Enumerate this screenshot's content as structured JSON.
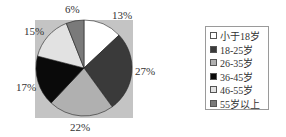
{
  "chart_data": {
    "type": "pie",
    "title": "",
    "categories": [
      "小于18岁",
      "18-25岁",
      "26-35岁",
      "36-45岁",
      "46-55岁",
      "55岁以上"
    ],
    "values": [
      13,
      27,
      22,
      17,
      15,
      6
    ],
    "labels": [
      "13%",
      "27%",
      "22%",
      "17%",
      "15%",
      "6%"
    ],
    "colors": [
      "#ffffff",
      "#3a3a3a",
      "#b0b0b0",
      "#0a0a0a",
      "#e2e2e2",
      "#7a7a7a"
    ],
    "start_angle_deg": 0,
    "direction": "clockwise",
    "legend_position": "right",
    "plot_background": "#c4c4c4"
  },
  "legend": {
    "items": [
      {
        "label": "小于18岁",
        "color": "#ffffff"
      },
      {
        "label": "18-25岁",
        "color": "#3a3a3a"
      },
      {
        "label": "26-35岁",
        "color": "#b0b0b0"
      },
      {
        "label": "36-45岁",
        "color": "#0a0a0a"
      },
      {
        "label": "46-55岁",
        "color": "#e2e2e2"
      },
      {
        "label": "55岁以上",
        "color": "#7a7a7a"
      }
    ]
  }
}
